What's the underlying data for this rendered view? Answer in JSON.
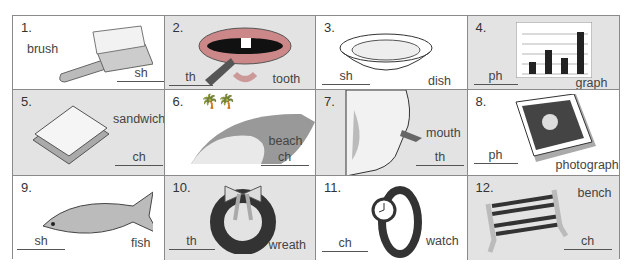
{
  "worksheet": {
    "items": [
      {
        "number": "1.",
        "word": "brush",
        "digraph": "sh",
        "picture": "hairbrush"
      },
      {
        "number": "2.",
        "word": "tooth",
        "digraph": "th",
        "picture": "mouth-with-tooth"
      },
      {
        "number": "3.",
        "word": "dish",
        "digraph": "sh",
        "picture": "bowl-dish"
      },
      {
        "number": "4.",
        "word": "graph",
        "digraph": "ph",
        "picture": "bar-graph"
      },
      {
        "number": "5.",
        "word": "sandwich",
        "digraph": "ch",
        "picture": "sandwich"
      },
      {
        "number": "6.",
        "word": "beach",
        "digraph": "ch",
        "picture": "beach-with-palms"
      },
      {
        "number": "7.",
        "word": "mouth",
        "digraph": "th",
        "picture": "face-profile-mouth"
      },
      {
        "number": "8.",
        "word": "photograph",
        "digraph": "ph",
        "picture": "framed-portrait-photo"
      },
      {
        "number": "9.",
        "word": "fish",
        "digraph": "sh",
        "picture": "fish"
      },
      {
        "number": "10.",
        "word": "wreath",
        "digraph": "th",
        "picture": "wreath-with-bow"
      },
      {
        "number": "11.",
        "word": "watch",
        "digraph": "ch",
        "picture": "wristwatch"
      },
      {
        "number": "12.",
        "word": "bench",
        "digraph": "ch",
        "picture": "park-bench"
      }
    ]
  },
  "colors": {
    "gray_cell": "#e3e3e3",
    "white_cell": "#ffffff",
    "border": "#8a8a8a"
  }
}
